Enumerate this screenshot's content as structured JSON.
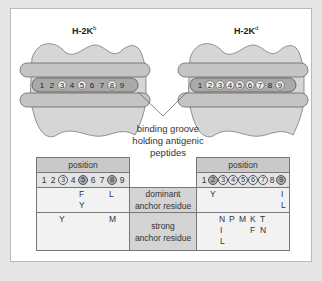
{
  "figure": {
    "alleles": [
      {
        "name": "H-2K",
        "superscript": "b"
      },
      {
        "name": "H-2K",
        "superscript": "d"
      }
    ],
    "peptide_positions": [
      "1",
      "2",
      "3",
      "4",
      "5",
      "6",
      "7",
      "8",
      "9"
    ],
    "groove_label": "binding groove holding antigenic peptides",
    "colors": {
      "background": "#e6e6e6",
      "panel": "#ffffff",
      "mhc_fill": "#d6d6d6",
      "helix_fill": "#c4c4c4",
      "header_fill": "#c9c9c9",
      "row_label_fill": "#d4d4d4"
    }
  },
  "table": {
    "left_header": "position",
    "right_header": "position",
    "left_positions": [
      "1",
      "2",
      "3",
      "4",
      "5",
      "6",
      "7",
      "8",
      "9"
    ],
    "left_circled": [
      "5",
      "8"
    ],
    "right_positions": [
      "1",
      "2",
      "3",
      "4",
      "5",
      "6",
      "7",
      "8",
      "9"
    ],
    "right_circled": [
      "2",
      "9"
    ],
    "rows": [
      {
        "label_line1": "dominant",
        "label_line2": "anchor residue",
        "H2Kb": [
          {
            "position": "5",
            "residues": [
              "F",
              "Y"
            ]
          },
          {
            "position": "8",
            "residues": [
              "L"
            ]
          }
        ],
        "H2Kd": [
          {
            "position": "2",
            "residues": [
              "Y"
            ]
          },
          {
            "position": "9",
            "residues": [
              "I",
              "L"
            ]
          }
        ]
      },
      {
        "label_line1": "strong",
        "label_line2": "anchor residue",
        "H2Kb": [
          {
            "position": "3",
            "residues": [
              "Y"
            ]
          },
          {
            "position": "9",
            "residues": [
              "M"
            ]
          }
        ],
        "H2Kd": [
          {
            "position": "3",
            "residues": [
              "N",
              "I",
              "L"
            ]
          },
          {
            "position": "4",
            "residues": [
              "P"
            ]
          },
          {
            "position": "5",
            "residues": [
              "M"
            ]
          },
          {
            "position": "6",
            "residues": [
              "K",
              "F"
            ]
          },
          {
            "position": "7",
            "residues": [
              "T",
              "N"
            ]
          }
        ]
      }
    ]
  }
}
